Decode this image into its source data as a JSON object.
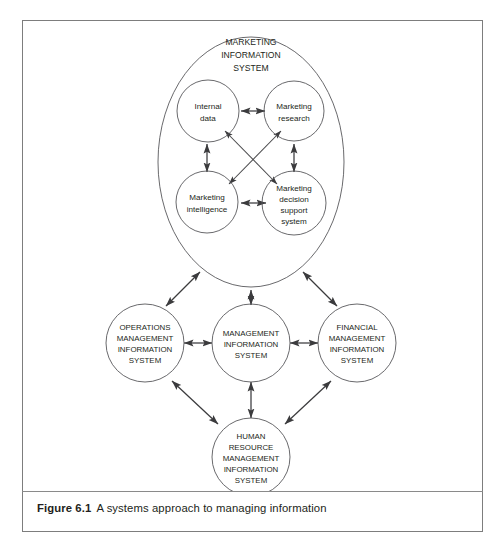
{
  "figure": {
    "caption_label": "Figure 6.1",
    "caption_text": "A systems approach to managing information"
  },
  "diagram": {
    "type": "systems-diagram",
    "container": {
      "name": "marketing-information-system",
      "shape": "ellipse",
      "label_lines": [
        "MARKETING",
        "INFORMATION",
        "SYSTEM"
      ]
    },
    "inner_nodes": [
      {
        "id": "internal-data",
        "lines": [
          "Internal",
          "data"
        ]
      },
      {
        "id": "marketing-research",
        "lines": [
          "Marketing",
          "research"
        ]
      },
      {
        "id": "marketing-intelligence",
        "lines": [
          "Marketing",
          "intelligence"
        ]
      },
      {
        "id": "marketing-decision-support",
        "lines": [
          "Marketing",
          "decision",
          "support",
          "system"
        ]
      }
    ],
    "outer_nodes": [
      {
        "id": "operations-management-information-system",
        "lines": [
          "OPERATIONS",
          "MANAGEMENT",
          "INFORMATION",
          "SYSTEM"
        ]
      },
      {
        "id": "management-information-system",
        "lines": [
          "MANAGEMENT",
          "INFORMATION",
          "SYSTEM"
        ]
      },
      {
        "id": "financial-management-information-system",
        "lines": [
          "FINANCIAL",
          "MANAGEMENT",
          "INFORMATION",
          "SYSTEM"
        ]
      },
      {
        "id": "human-resource-management-information-system",
        "lines": [
          "HUMAN",
          "RESOURCE",
          "MANAGEMENT",
          "INFORMATION",
          "SYSTEM"
        ]
      }
    ],
    "connections": [
      {
        "from": "internal-data",
        "to": "marketing-research",
        "arrows": "both"
      },
      {
        "from": "internal-data",
        "to": "marketing-intelligence",
        "arrows": "both"
      },
      {
        "from": "marketing-research",
        "to": "marketing-decision-support",
        "arrows": "both"
      },
      {
        "from": "marketing-intelligence",
        "to": "marketing-decision-support",
        "arrows": "both"
      },
      {
        "from": "internal-data",
        "to": "marketing-decision-support",
        "arrows": "both"
      },
      {
        "from": "marketing-research",
        "to": "marketing-intelligence",
        "arrows": "both"
      },
      {
        "from": "marketing-information-system",
        "to": "operations-management-information-system",
        "arrows": "both"
      },
      {
        "from": "marketing-information-system",
        "to": "management-information-system",
        "arrows": "both"
      },
      {
        "from": "marketing-information-system",
        "to": "financial-management-information-system",
        "arrows": "both"
      },
      {
        "from": "operations-management-information-system",
        "to": "management-information-system",
        "arrows": "both"
      },
      {
        "from": "management-information-system",
        "to": "financial-management-information-system",
        "arrows": "both"
      },
      {
        "from": "operations-management-information-system",
        "to": "human-resource-management-information-system",
        "arrows": "both"
      },
      {
        "from": "management-information-system",
        "to": "human-resource-management-information-system",
        "arrows": "both"
      },
      {
        "from": "financial-management-information-system",
        "to": "human-resource-management-information-system",
        "arrows": "both"
      }
    ],
    "colors": {
      "stroke": "#58585b",
      "arrow": "#3b3b3d",
      "text": "#231f20",
      "frame": "#7d7d7d",
      "background": "#ffffff"
    }
  }
}
